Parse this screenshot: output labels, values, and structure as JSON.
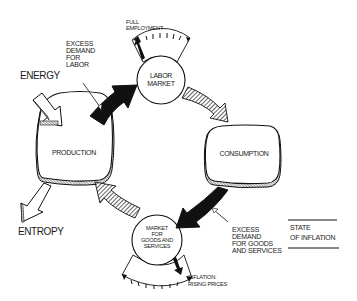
{
  "diagram": {
    "title": "State of Inflation",
    "legend": {
      "line1": "STATE",
      "line2": "OF INFLATION"
    },
    "nodes": {
      "production": "PRODUCTION",
      "consumption": "CONSUMPTION",
      "labor_market": {
        "line1": "LABOR",
        "line2": "MARKET"
      },
      "goods_market": {
        "line1": "MARKET",
        "line2": "FOR",
        "line3": "GOODS AND",
        "line4": "SERVICES"
      }
    },
    "inputs": {
      "energy": "ENERGY",
      "entropy": "ENTROPY"
    },
    "annotations": {
      "excess_labor": {
        "line1": "EXCESS",
        "line2": "DEMAND",
        "line3": "FOR",
        "line4": "LABOR"
      },
      "excess_goods": {
        "line1": "EXCESS",
        "line2": "DEMAND",
        "line3": "FOR GOODS",
        "line4": "AND SERVICES"
      },
      "full_employment": {
        "line1": "FULL",
        "line2": "EMPLOYMENT"
      },
      "inflation": {
        "line1": "INFLATION:",
        "line2": "RISING PRICES"
      }
    },
    "arrows": [
      {
        "from": "energy",
        "to": "production",
        "style": "outline"
      },
      {
        "from": "production",
        "to": "entropy",
        "style": "outline"
      },
      {
        "from": "production",
        "to": "labor_market",
        "style": "solid-black"
      },
      {
        "from": "labor_market",
        "to": "consumption",
        "style": "hatched"
      },
      {
        "from": "consumption",
        "to": "goods_market",
        "style": "solid-black"
      },
      {
        "from": "goods_market",
        "to": "production",
        "style": "hatched"
      }
    ],
    "gauges": {
      "labor_market": {
        "indicator": "full_employment",
        "needle_position": "max"
      },
      "goods_market": {
        "indicator": "inflation_rising_prices",
        "needle_position": "max"
      }
    }
  }
}
